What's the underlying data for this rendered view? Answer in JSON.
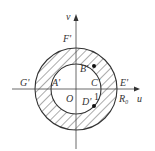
{
  "diagram": {
    "axes": {
      "horizontal_label": "u",
      "vertical_label": "v"
    },
    "labels": {
      "F": "F'",
      "G": "G'",
      "A": "A'",
      "O": "O",
      "B": "B'",
      "C": "C'",
      "D": "D'",
      "E": "E'",
      "R0": "R₀",
      "one": "1"
    },
    "shapes": {
      "outer_circle": "radius R0",
      "inner_circle": "radius 1",
      "shaded_region": "annulus between inner and outer circles (hatched)"
    },
    "colors": {
      "stroke": "#333333",
      "hatch": "#444444",
      "background": "#ffffff"
    }
  }
}
